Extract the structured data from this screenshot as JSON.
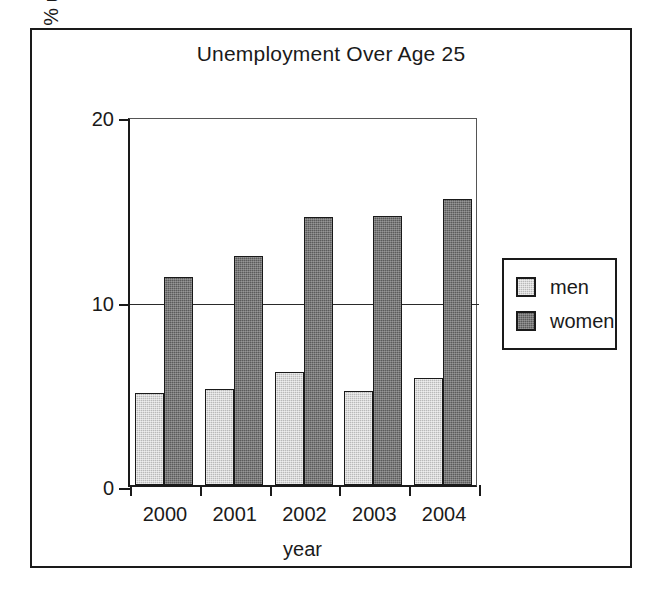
{
  "chart_data": {
    "type": "bar",
    "title": "Unemployment Over Age 25",
    "xlabel": "year",
    "ylabel": "% unemployed",
    "categories": [
      "2000",
      "2001",
      "2002",
      "2003",
      "2004"
    ],
    "series": [
      {
        "name": "men",
        "values": [
          5.0,
          5.2,
          6.1,
          5.1,
          5.8
        ],
        "color": "#b9b9b9"
      },
      {
        "name": "women",
        "values": [
          11.3,
          12.4,
          14.5,
          14.6,
          15.5
        ],
        "color": "#5b5b5b"
      }
    ],
    "ylim": [
      0,
      20
    ],
    "yticks": [
      0,
      10,
      20
    ],
    "ytick_labels": [
      "0",
      "10",
      "20"
    ],
    "grid": "horizontal-at-10",
    "legend_position": "right-outside",
    "legend_entries": [
      "men",
      "women"
    ]
  },
  "legend": {
    "entries": [
      {
        "label": "men"
      },
      {
        "label": "women"
      }
    ]
  }
}
